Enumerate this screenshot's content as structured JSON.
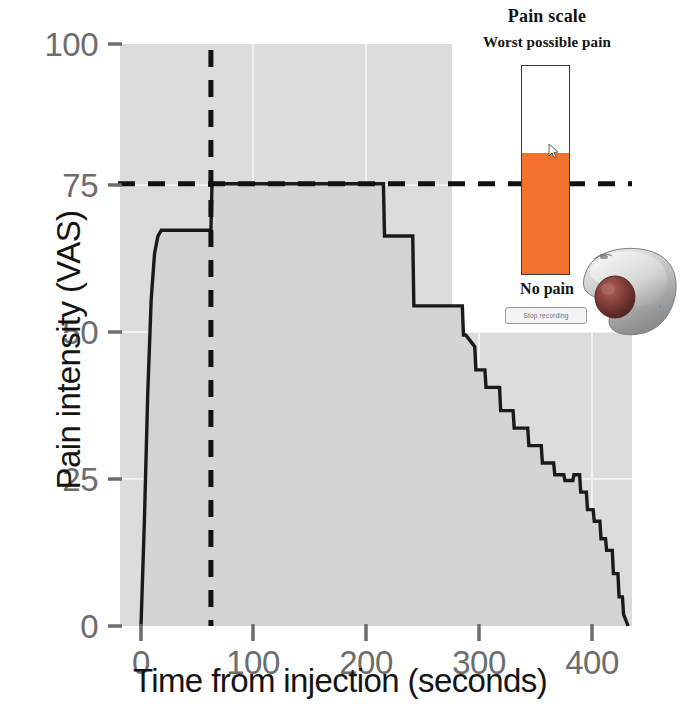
{
  "figure": {
    "background": "#ffffff",
    "plot_fill": "#dcdcdc",
    "line_color": "#1a1a1a"
  },
  "axes": {
    "x_title": "Time from injection (seconds)",
    "y_title": "Pain intensity (VAS)",
    "x_ticks": [
      "0",
      "100",
      "200",
      "300",
      "400"
    ],
    "x_tick_values": [
      0,
      100,
      200,
      300,
      400
    ],
    "y_ticks": [
      "0",
      "25",
      "50",
      "75",
      "100"
    ],
    "y_tick_values": [
      0,
      25,
      50,
      75,
      100
    ],
    "tick_color": "#6d6d6d"
  },
  "annotations": {
    "vertical_dashed_label": "",
    "vertical_dashed_x": 62,
    "horizontal_dashed_label": "",
    "horizontal_dashed_y": 76,
    "dash_color": "#111111"
  },
  "inset": {
    "title": "Pain scale",
    "top_label": "Worst possible pain",
    "bottom_label": "No pain",
    "stop_button_label": "Stop recording",
    "fill_percent": 58,
    "fill_color": "#f2722e",
    "bar_border_color": "#3b3b3b",
    "device_name": "trackball-mouse",
    "device_ball_color": "#7d3b35"
  },
  "chart_data": {
    "type": "area",
    "title": "",
    "xlabel": "Time from injection (seconds)",
    "ylabel": "Pain intensity (VAS)",
    "xlim": [
      0,
      435
    ],
    "ylim": [
      0,
      100
    ],
    "grid": true,
    "legend": "none",
    "annotations": {
      "vline_x": 62,
      "hline_y": 76
    },
    "series": [
      {
        "name": "Pain intensity (VAS)",
        "x": [
          0,
          3,
          6,
          9,
          12,
          15,
          18,
          62,
          63,
          215,
          216,
          241,
          242,
          285,
          286,
          288,
          296,
          297,
          305,
          306,
          318,
          319,
          330,
          331,
          343,
          344,
          355,
          356,
          366,
          367,
          375,
          376,
          383,
          384,
          389,
          390,
          395,
          396,
          401,
          402,
          407,
          408,
          412,
          413,
          418,
          419,
          423,
          424,
          427,
          428,
          430,
          432
        ],
        "y": [
          0,
          18,
          40,
          56,
          64,
          67,
          68,
          68,
          76,
          76,
          67,
          67,
          55,
          55,
          50,
          50,
          48,
          44,
          44,
          41,
          41,
          37,
          37,
          34,
          34,
          31,
          31,
          28,
          28,
          26,
          26,
          25,
          25,
          26,
          26,
          23,
          23,
          20,
          20,
          18,
          18,
          15,
          15,
          13,
          13,
          9,
          9,
          5,
          5,
          2,
          1,
          0
        ]
      }
    ]
  }
}
